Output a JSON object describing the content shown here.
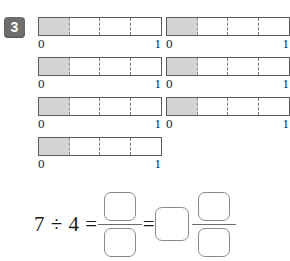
{
  "exercise": {
    "number": "3",
    "badge_color": "#6e6e6e"
  },
  "colors": {
    "shaded_fill": "#d4d4d4",
    "bar_stroke": "#5a5a5a",
    "divider": "#7a7a7a",
    "box_stroke": "#8a8a8a"
  },
  "bars": {
    "segments_per_bar": 4,
    "filled_segments": 1,
    "label_left": "0",
    "label_right": "1",
    "count": 7,
    "left_column": [
      {
        "label_left": "0",
        "label_right": "1"
      },
      {
        "label_left": "0",
        "label_right": "1"
      },
      {
        "label_left": "0",
        "label_right": "1"
      },
      {
        "label_left": "0",
        "label_right": "1"
      }
    ],
    "right_column": [
      {
        "label_left": "0",
        "label_right": "1"
      },
      {
        "label_left": "0",
        "label_right": "1"
      },
      {
        "label_left": "0",
        "label_right": "1"
      }
    ]
  },
  "equation": {
    "dividend": "7",
    "divide_sign": "÷",
    "divisor": "4",
    "equals_1": "=",
    "equals_2": "=",
    "fraction_numerator": "",
    "fraction_denominator": "",
    "mixed_whole": "",
    "mixed_numerator": "",
    "mixed_denominator": "",
    "expression_text": "7 ÷ 4 ="
  }
}
